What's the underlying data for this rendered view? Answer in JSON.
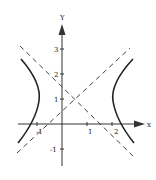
{
  "diagram": {
    "title": "",
    "type": "hyperbola with asymptotes",
    "axes": {
      "x_label": "x",
      "y_label": "Y",
      "x_ticks": [
        {
          "value": -1,
          "label": "-1"
        },
        {
          "value": 1,
          "label": "1"
        },
        {
          "value": 2,
          "label": "2"
        }
      ],
      "y_ticks": [
        {
          "value": -1,
          "label": "-1"
        },
        {
          "value": 1,
          "label": "1"
        },
        {
          "value": 2,
          "label": "2"
        },
        {
          "value": 3,
          "label": "3"
        }
      ]
    },
    "hyperbola": {
      "center": [
        0.5,
        1
      ],
      "a": 1.5,
      "b": 1.4,
      "orientation": "horizontal",
      "style": "solid"
    },
    "asymptotes": [
      {
        "slope": 0.93,
        "through": [
          0.5,
          1
        ],
        "style": "dashed"
      },
      {
        "slope": -0.93,
        "through": [
          0.5,
          1
        ],
        "style": "dashed"
      }
    ],
    "colors": {
      "curve": "#222222",
      "axis": "#333333",
      "dash": "#444444",
      "background": "#ffffff"
    }
  }
}
